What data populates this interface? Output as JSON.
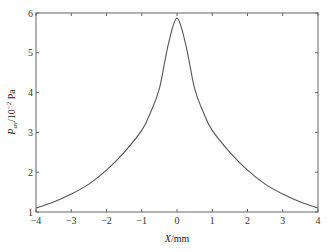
{
  "chart_data": {
    "type": "line",
    "title": "",
    "xlabel": "X/mm",
    "ylabel": "P_av/10^-2 Pa",
    "xlim": [
      -4,
      4
    ],
    "ylim": [
      1,
      6
    ],
    "xticks": [
      -4,
      -3,
      -2,
      -1,
      0,
      1,
      2,
      3,
      4
    ],
    "yticks": [
      1,
      2,
      3,
      4,
      5,
      6
    ],
    "grid": false,
    "legend": null,
    "series": [
      {
        "name": "P_av",
        "color": "#555555",
        "x": [
          -4,
          -3.5,
          -3,
          -2.5,
          -2,
          -1.5,
          -1,
          -0.75,
          -0.5,
          -0.25,
          0,
          0.25,
          0.5,
          0.75,
          1,
          1.5,
          2,
          2.5,
          3,
          3.5,
          4
        ],
        "y": [
          1.1,
          1.25,
          1.45,
          1.7,
          2.05,
          2.5,
          3.05,
          3.5,
          4.1,
          5.2,
          5.87,
          5.2,
          4.1,
          3.5,
          3.05,
          2.5,
          2.05,
          1.7,
          1.45,
          1.25,
          1.1
        ]
      }
    ]
  },
  "axis": {
    "xlabel_main": "X",
    "xlabel_unit": "/mm",
    "ylabel_main": "P",
    "ylabel_sub": "av",
    "ylabel_unit": "/10",
    "ylabel_exp": "−2",
    "ylabel_tail": " Pa"
  },
  "colors": {
    "axis": "#666666",
    "line": "#555555"
  }
}
